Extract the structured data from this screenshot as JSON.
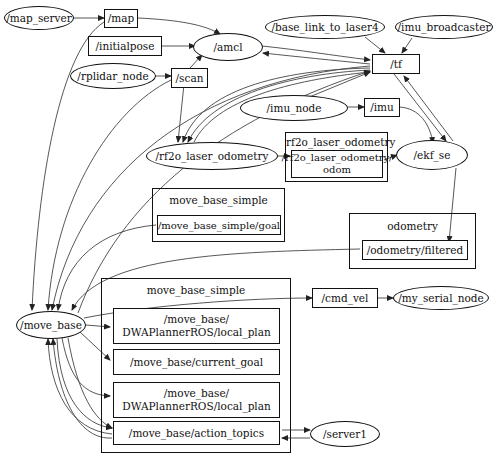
{
  "graph": {
    "type": "ros_rqt_graph",
    "nodes": {
      "map_server": "/map_server",
      "amcl": "/amcl",
      "rplidar_node": "/rplidar_node",
      "base_link_to_laser4": "/base_link_to_laser4",
      "imu_broadcaster": "/imu_broadcaster",
      "imu_node": "/imu_node",
      "rf2o_laser_odometry": "/rf2o_laser_odometry",
      "ekf_se": "/ekf_se",
      "move_base": "/move_base",
      "my_serial_node": "/my_serial_node",
      "server1": "/server1"
    },
    "topics": {
      "map": "/map",
      "initialpose": "/initialpose",
      "scan": "/scan",
      "tf": "/tf",
      "imu": "/imu",
      "rf2o_odom": "/rf2o_laser_odometry/\nodom",
      "move_base_simple_goal": "/move_base_simple/goal",
      "odometry_filtered": "/odometry/filtered",
      "cmd_vel": "/cmd_vel",
      "dwa_local_plan_1": "/move_base/\nDWAPlannerROS/local_plan",
      "current_goal": "/move_base/current_goal",
      "dwa_local_plan_2": "/move_base/\nDWAPlannerROS/local_plan",
      "action_topics": "/move_base/action_topics"
    },
    "clusters": {
      "rf2o_laser_odometry": "rf2o_laser_odometry",
      "move_base_simple_top": "move_base_simple",
      "odometry": "odometry",
      "move_base_simple_big": "move_base_simple"
    },
    "edges": [
      [
        "/map_server",
        "/map"
      ],
      [
        "/map",
        "/amcl"
      ],
      [
        "/initialpose",
        "/amcl"
      ],
      [
        "/rplidar_node",
        "/scan"
      ],
      [
        "/scan",
        "/amcl"
      ],
      [
        "/scan",
        "/rf2o_laser_odometry"
      ],
      [
        "/amcl",
        "/tf"
      ],
      [
        "/tf",
        "/amcl"
      ],
      [
        "/base_link_to_laser4",
        "/tf"
      ],
      [
        "/imu_broadcaster",
        "/tf"
      ],
      [
        "/imu_node",
        "/tf"
      ],
      [
        "/imu_node",
        "/imu"
      ],
      [
        "/imu",
        "/ekf_se"
      ],
      [
        "/tf",
        "/ekf_se"
      ],
      [
        "/ekf_se",
        "/tf"
      ],
      [
        "/tf",
        "/rf2o_laser_odometry"
      ],
      [
        "/rf2o_laser_odometry",
        "/tf"
      ],
      [
        "/rf2o_laser_odometry",
        "/rf2o_laser_odometry/odom"
      ],
      [
        "/rf2o_laser_odometry/odom",
        "/ekf_se"
      ],
      [
        "/ekf_se",
        "/odometry/filtered"
      ],
      [
        "/odometry/filtered",
        "/move_base"
      ],
      [
        "/move_base_simple/goal",
        "/move_base"
      ],
      [
        "/map",
        "/move_base"
      ],
      [
        "/scan",
        "/move_base"
      ],
      [
        "/tf",
        "/move_base"
      ],
      [
        "/move_base",
        "/tf"
      ],
      [
        "/move_base",
        "/cmd_vel"
      ],
      [
        "/cmd_vel",
        "/my_serial_node"
      ],
      [
        "/move_base",
        "/move_base/DWAPlannerROS/local_plan"
      ],
      [
        "/move_base",
        "/move_base/current_goal"
      ],
      [
        "/move_base",
        "/move_base/action_topics"
      ],
      [
        "/move_base/action_topics",
        "/move_base"
      ],
      [
        "/move_base/action_topics",
        "/server1"
      ],
      [
        "/server1",
        "/move_base/action_topics"
      ]
    ]
  }
}
